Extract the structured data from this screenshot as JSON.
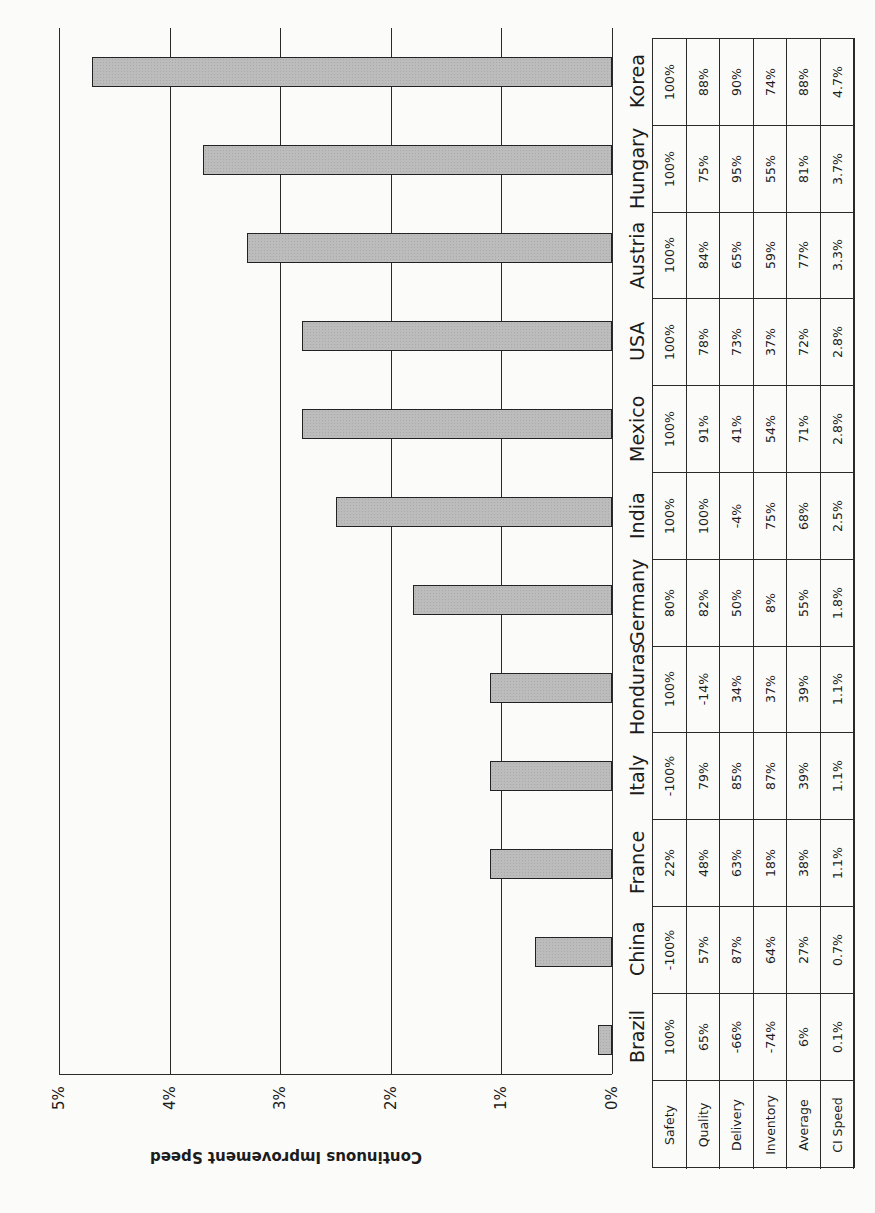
{
  "chart_data": {
    "type": "bar",
    "orientation": "page rotated 90deg counter-clockwise; bars extend from 0% baseline",
    "title": "",
    "ylabel": "Continuous Improvement Speed",
    "xlabel": "",
    "ylim": [
      0,
      5
    ],
    "y_ticks": [
      "0%",
      "1%",
      "2%",
      "3%",
      "4%",
      "5%"
    ],
    "grid": true,
    "categories": [
      "Brazil",
      "China",
      "France",
      "Italy",
      "Honduras",
      "Germany",
      "India",
      "Mexico",
      "USA",
      "Austria",
      "Hungary",
      "Korea"
    ],
    "series": [
      {
        "name": "CI Speed",
        "values": [
          0.1,
          0.7,
          1.1,
          1.1,
          1.1,
          1.8,
          2.5,
          2.8,
          2.8,
          3.3,
          3.7,
          4.7
        ]
      }
    ],
    "table": {
      "row_headers": [
        "Safety",
        "Quality",
        "Delivery",
        "Inventory",
        "Average",
        "CI Speed"
      ],
      "columns": [
        {
          "country": "Brazil",
          "values": [
            "100%",
            "65%",
            "-66%",
            "-74%",
            "6%",
            "0.1%"
          ]
        },
        {
          "country": "China",
          "values": [
            "-100%",
            "57%",
            "87%",
            "64%",
            "27%",
            "0.7%"
          ]
        },
        {
          "country": "France",
          "values": [
            "22%",
            "48%",
            "63%",
            "18%",
            "38%",
            "1.1%"
          ]
        },
        {
          "country": "Italy",
          "values": [
            "-100%",
            "79%",
            "85%",
            "87%",
            "39%",
            "1.1%"
          ]
        },
        {
          "country": "Honduras",
          "values": [
            "100%",
            "-14%",
            "34%",
            "37%",
            "39%",
            "1.1%"
          ]
        },
        {
          "country": "Germany",
          "values": [
            "80%",
            "82%",
            "50%",
            "8%",
            "55%",
            "1.8%"
          ]
        },
        {
          "country": "India",
          "values": [
            "100%",
            "100%",
            "-4%",
            "75%",
            "68%",
            "2.5%"
          ]
        },
        {
          "country": "Mexico",
          "values": [
            "100%",
            "91%",
            "41%",
            "54%",
            "71%",
            "2.8%"
          ]
        },
        {
          "country": "USA",
          "values": [
            "100%",
            "78%",
            "73%",
            "37%",
            "72%",
            "2.8%"
          ]
        },
        {
          "country": "Austria",
          "values": [
            "100%",
            "84%",
            "65%",
            "59%",
            "77%",
            "3.3%"
          ]
        },
        {
          "country": "Hungary",
          "values": [
            "100%",
            "75%",
            "95%",
            "55%",
            "81%",
            "3.7%"
          ]
        },
        {
          "country": "Korea",
          "values": [
            "100%",
            "88%",
            "90%",
            "74%",
            "88%",
            "4.7%"
          ]
        }
      ]
    }
  },
  "colors": {
    "bar_fill": "#bcbcbc",
    "bar_border": "#222222",
    "lines": "#2a2a2a",
    "background": "#fbfbfa"
  }
}
